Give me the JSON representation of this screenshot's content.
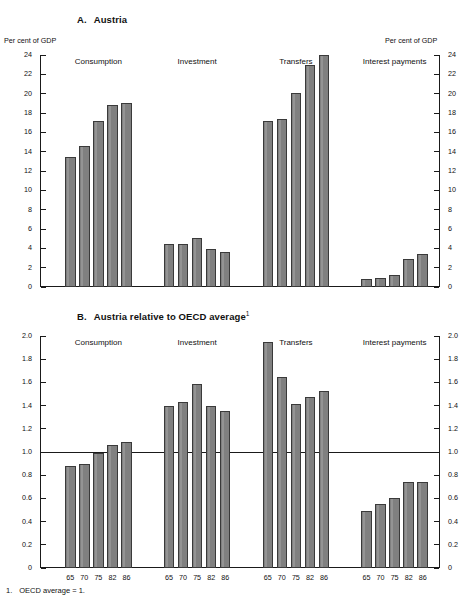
{
  "figure": {
    "footnote_number": "1.",
    "footnote_text": "OECD average = 1."
  },
  "panelA": {
    "letter": "A.",
    "title": "Austria",
    "unit_left": "Per cent of GDP",
    "unit_right": "Per cent of GDP"
  },
  "panelB": {
    "letter": "B.",
    "title": "Austria relative to OECD average",
    "title_sup": "1"
  },
  "chart_data": [
    {
      "type": "bar",
      "title": "A. Austria",
      "ylabel": "Per cent of GDP",
      "xlabel": "",
      "ylim": [
        0,
        24
      ],
      "yticks": [
        0,
        2,
        4,
        6,
        8,
        10,
        12,
        14,
        16,
        18,
        20,
        22,
        24
      ],
      "ytick_labels": [
        "0",
        "2",
        "4",
        "6",
        "8",
        "10",
        "12",
        "14",
        "16",
        "18",
        "20",
        "22",
        "24"
      ],
      "categories": [
        "65",
        "70",
        "75",
        "82",
        "86"
      ],
      "grid": false,
      "legend": "none",
      "groups": [
        {
          "name": "Consumption",
          "values": [
            13.4,
            14.6,
            17.2,
            18.8,
            19.0
          ]
        },
        {
          "name": "Investment",
          "values": [
            4.5,
            4.5,
            5.1,
            3.9,
            3.6
          ]
        },
        {
          "name": "Transfers",
          "values": [
            17.2,
            17.4,
            20.1,
            23.0,
            24.0
          ]
        },
        {
          "name": "Interest payments",
          "values": [
            0.8,
            0.9,
            1.2,
            2.9,
            3.4
          ]
        }
      ]
    },
    {
      "type": "bar",
      "title": "B. Austria relative to OECD average",
      "ylabel": "",
      "xlabel": "",
      "ylim": [
        0,
        2.0
      ],
      "yticks": [
        0,
        0.2,
        0.4,
        0.6,
        0.8,
        1.0,
        1.2,
        1.4,
        1.6,
        1.8,
        2.0
      ],
      "ytick_labels": [
        "0",
        "0.2",
        "0.4",
        "0.6",
        "0.8",
        "1.0",
        "1.2",
        "1.4",
        "1.6",
        "1.8",
        "2.0"
      ],
      "categories": [
        "65",
        "70",
        "75",
        "82",
        "86"
      ],
      "reference_line": 1.0,
      "grid": false,
      "legend": "none",
      "groups": [
        {
          "name": "Consumption",
          "values": [
            0.88,
            0.9,
            0.99,
            1.06,
            1.09
          ]
        },
        {
          "name": "Investment",
          "values": [
            1.4,
            1.43,
            1.59,
            1.4,
            1.35
          ]
        },
        {
          "name": "Transfers",
          "values": [
            1.95,
            1.65,
            1.41,
            1.47,
            1.53
          ]
        },
        {
          "name": "Interest payments",
          "values": [
            0.49,
            0.55,
            0.6,
            0.74,
            0.74
          ]
        }
      ]
    }
  ]
}
